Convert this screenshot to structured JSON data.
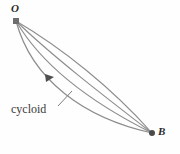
{
  "figure": {
    "background_color": "#fefefe",
    "curve_color": "#8a8a8a",
    "marker_color": "#555555",
    "label_color": "#2b2b2b",
    "points": [
      {
        "id": "O",
        "label": "O",
        "x": 16,
        "y": 21,
        "marker": "square"
      },
      {
        "id": "B",
        "label": "B",
        "x": 152,
        "y": 133,
        "marker": "round"
      }
    ],
    "annotation": {
      "label": "cycloid",
      "leader_from_x": 58,
      "leader_from_y": 106,
      "leader_to_x": 72,
      "leader_to_y": 91
    },
    "direction_arrow": {
      "name": "direction-arrow-marker",
      "x": 50,
      "y": 77
    }
  },
  "chart_data": {
    "type": "line",
    "title": "cycloid",
    "xlabel": "",
    "ylabel": "",
    "xlim": [
      0,
      180
    ],
    "ylim": [
      0,
      154
    ],
    "grid": false,
    "legend": "none",
    "annotations": [
      {
        "text": "O",
        "x": 16,
        "y": 21
      },
      {
        "text": "B",
        "x": 152,
        "y": 133
      },
      {
        "text": "cycloid",
        "x": 34,
        "y": 110
      }
    ],
    "series": [
      {
        "name": "path-1-shallow",
        "path": "M16,21 C62,48 112,88 152,133"
      },
      {
        "name": "path-2",
        "path": "M16,21 C52,56 104,96 152,133"
      },
      {
        "name": "path-3",
        "path": "M16,21 C42,66 94,104 152,133"
      },
      {
        "name": "path-4-cycloid",
        "path": "M16,21 C32,80 84,118 152,133"
      }
    ]
  }
}
